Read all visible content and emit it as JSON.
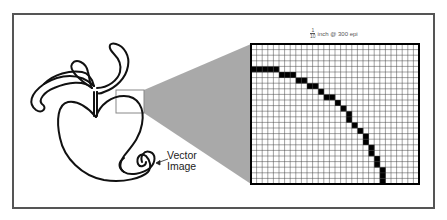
{
  "diagram": {
    "caption": {
      "numerator": "1",
      "denominator": "10",
      "text": "inch @ 300 epi"
    },
    "vector_label": {
      "line1": "Vector",
      "line2": "Image"
    },
    "grid": {
      "columns": 30,
      "rows": 25,
      "filled_cells": [
        [
          4,
          0
        ],
        [
          4,
          1
        ],
        [
          4,
          2
        ],
        [
          4,
          3
        ],
        [
          4,
          4
        ],
        [
          5,
          5
        ],
        [
          5,
          6
        ],
        [
          5,
          7
        ],
        [
          6,
          8
        ],
        [
          6,
          9
        ],
        [
          7,
          10
        ],
        [
          7,
          11
        ],
        [
          8,
          12
        ],
        [
          9,
          13
        ],
        [
          9,
          14
        ],
        [
          10,
          15
        ],
        [
          11,
          16
        ],
        [
          12,
          17
        ],
        [
          13,
          17
        ],
        [
          14,
          18
        ],
        [
          15,
          19
        ],
        [
          16,
          20
        ],
        [
          17,
          20
        ],
        [
          18,
          21
        ],
        [
          19,
          21
        ],
        [
          20,
          22
        ],
        [
          21,
          22
        ],
        [
          22,
          23
        ],
        [
          23,
          23
        ],
        [
          24,
          23
        ]
      ]
    },
    "colors": {
      "frame": "#555555",
      "cone": "#9a9a9a",
      "grid_line": "#444444",
      "pixel_fill": "#000000",
      "vector_stroke": "#111111",
      "zoom_box": "#888888"
    }
  }
}
